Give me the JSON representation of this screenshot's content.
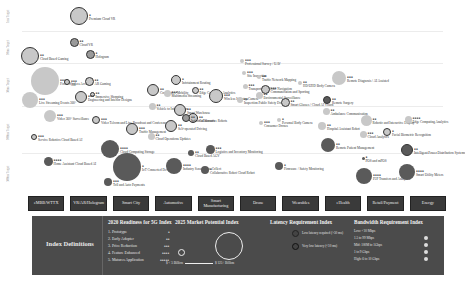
{
  "chart_data": {
    "type": "bubble",
    "ylabel": "Latency Target",
    "row_labels": [
      "1ms Target",
      "10ms Target",
      "50ms Target",
      "100ms Target",
      "500ms Target"
    ],
    "categories": [
      "eMBB/WTTX",
      "VR/AR/Hologram",
      "Smart City",
      "Automotive",
      "Smart Manufacturing",
      "Drone",
      "Wearables",
      "eHealth",
      "Retail/Payment",
      "Energy"
    ],
    "points": [
      {
        "label": "Premium Cloud VR",
        "readiness": "●",
        "x": 79,
        "y": 16,
        "r": 9,
        "shade": "light-ring"
      },
      {
        "label": "Cloud Based Gaming",
        "readiness": "●●",
        "x": 30,
        "y": 56,
        "r": 9,
        "shade": "light-ring"
      },
      {
        "label": "Cloud VR",
        "readiness": "●●",
        "x": 74,
        "y": 42,
        "r": 4.5,
        "shade": "mid-ring"
      },
      {
        "label": "Hologram",
        "readiness": "●",
        "x": 90,
        "y": 54,
        "r": 4.5,
        "shade": "mid-ring"
      },
      {
        "label": "Fixed Wireless Access",
        "readiness": "●●●●",
        "x": 45,
        "y": 81,
        "r": 14,
        "shade": "light"
      },
      {
        "label": "AR",
        "readiness": "●●●",
        "x": 67,
        "y": 82,
        "r": 3,
        "shade": "light-ring"
      },
      {
        "label": "AR Gaming",
        "readiness": "●●",
        "x": 89,
        "y": 81,
        "r": 4.5,
        "shade": "light-ring"
      },
      {
        "label": "Immersive Shopping",
        "readiness": "●●",
        "x": 92,
        "y": 94,
        "r": 2.5,
        "shade": "light-ring"
      },
      {
        "label": "Engineering and Interior Designs",
        "readiness": "●●●",
        "x": 81,
        "y": 97,
        "r": 6,
        "shade": "light-ring"
      },
      {
        "label": "Live Streaming Events 360°",
        "readiness": "●●●",
        "x": 30,
        "y": 100,
        "r": 8,
        "shade": "light"
      },
      {
        "label": "Video 360° Surveillance",
        "readiness": "●●●",
        "x": 50,
        "y": 116,
        "r": 6,
        "shade": "light"
      },
      {
        "label": "Video Telcom and Live Broadcast and Conferences",
        "readiness": "●●●",
        "x": 96,
        "y": 120,
        "r": 4,
        "shade": "light-ring"
      },
      {
        "label": "Service Robotics Cloud Based AI",
        "readiness": "●●●",
        "x": 34,
        "y": 137,
        "r": 3,
        "shade": "light-ring"
      },
      {
        "label": "Home Assistant Cloud Based AI",
        "readiness": "●●●●",
        "x": 48,
        "y": 161,
        "r": 4.5,
        "shade": "dark"
      },
      {
        "label": "Traffic Management",
        "readiness": "●●●",
        "x": 132,
        "y": 129,
        "r": 6,
        "shade": "light-ring"
      },
      {
        "label": "Cloud Computing Storage",
        "readiness": "●●●●",
        "x": 110,
        "y": 149,
        "r": 9,
        "shade": "dark"
      },
      {
        "label": "IoT Connected Devices",
        "readiness": "●",
        "x": 127,
        "y": 167,
        "r": 14,
        "shade": "dark"
      },
      {
        "label": "Toll and Auto Payments",
        "readiness": "●●●",
        "x": 108,
        "y": 182,
        "r": 4,
        "shade": "dark"
      },
      {
        "label": "Cloud Operations Updates",
        "readiness": "●●",
        "x": 151,
        "y": 136,
        "r": 3.5,
        "shade": "light"
      },
      {
        "label": "Cooperative Mobility",
        "readiness": "●●",
        "x": 153,
        "y": 90,
        "r": 6,
        "shade": "light-ring"
      },
      {
        "label": "Vehicle to Infrastructure",
        "readiness": "●●",
        "x": 152,
        "y": 106,
        "r": 3.5,
        "shade": "light"
      },
      {
        "label": "Infotainment Routing",
        "readiness": "●",
        "x": 176,
        "y": 80,
        "r": 5,
        "shade": "light-ring"
      },
      {
        "label": "Multimedia Streaming",
        "readiness": "●●●",
        "x": 167,
        "y": 93,
        "r": 3.5,
        "shade": "light"
      },
      {
        "label": "Smart Warehouse",
        "readiness": "●●",
        "x": 180,
        "y": 110,
        "r": 6,
        "shade": "light-ring"
      },
      {
        "label": "Self-operated Driving",
        "readiness": "●●",
        "x": 171,
        "y": 126,
        "r": 6,
        "shade": "light-ring"
      },
      {
        "label": "Edge Computing Analytics",
        "readiness": "●●",
        "x": 195,
        "y": 90,
        "r": 3.5,
        "shade": "light-ring"
      },
      {
        "label": "Wireless Industry Camera",
        "readiness": "●●●",
        "x": 216,
        "y": 96,
        "r": 7,
        "shade": "light-ring"
      },
      {
        "label": "Collaborative Robots",
        "readiness": "●●",
        "x": 193,
        "y": 118,
        "r": 5,
        "shade": "light-ring"
      },
      {
        "label": "Industrial Sensors",
        "readiness": "●●",
        "x": 186,
        "y": 118,
        "r": 4,
        "shade": "mid-ring"
      },
      {
        "label": "Logistics and Inventory Monitoring",
        "readiness": "●●●",
        "x": 210,
        "y": 149,
        "r": 4.5,
        "shade": "dark"
      },
      {
        "label": "Cloud Based AGV",
        "readiness": "●●",
        "x": 191,
        "y": 153,
        "r": 3,
        "shade": "dark"
      },
      {
        "label": "Industry Sensor Data Collect",
        "readiness": "●●●●",
        "x": 174,
        "y": 166,
        "r": 8,
        "shade": "dark"
      },
      {
        "label": "Collaborative Robot Cloud Robot",
        "readiness": "●",
        "x": 205,
        "y": 170,
        "r": 4,
        "shade": "dark"
      },
      {
        "label": "Professional Survey / UAV",
        "readiness": "●●●",
        "x": 242,
        "y": 61,
        "r": 2,
        "shade": "light"
      },
      {
        "label": "Site Inspection",
        "readiness": "●●●",
        "x": 244,
        "y": 73,
        "r": 2,
        "shade": "light"
      },
      {
        "label": "Traffic Network Mapping",
        "readiness": "●●",
        "x": 259,
        "y": 77,
        "r": 2,
        "shade": "light"
      },
      {
        "label": "Transportation Route Navigation",
        "readiness": "●●●",
        "x": 245,
        "y": 86,
        "r": 2.5,
        "shade": "light"
      },
      {
        "label": "Environmental Surveillance",
        "readiness": "●●",
        "x": 259,
        "y": 95,
        "r": 3.5,
        "shade": "light"
      },
      {
        "label": "Inspection Public Safety Drones",
        "readiness": "●●",
        "x": 240,
        "y": 100,
        "r": 3,
        "shade": "light"
      },
      {
        "label": "Consumer Drones",
        "readiness": "●●●",
        "x": 261,
        "y": 123,
        "r": 2,
        "shade": "light"
      },
      {
        "label": "Firmware / Safety Monitoring",
        "readiness": "●",
        "x": 279,
        "y": 166,
        "r": 4,
        "shade": "dark"
      },
      {
        "label": "Communication and Sporting",
        "readiness": "●●●",
        "x": 265,
        "y": 89,
        "r": 4.5,
        "shade": "light-ring"
      },
      {
        "label": "Smart Glasses / Cloud AI Vision",
        "readiness": "●●",
        "x": 285,
        "y": 102,
        "r": 4.5,
        "shade": "light-ring"
      },
      {
        "label": "Personal Body Camera",
        "readiness": "●",
        "x": 279,
        "y": 120,
        "r": 2,
        "shade": "light"
      },
      {
        "label": "HD/UHD Body Camera",
        "readiness": "●●",
        "x": 300,
        "y": 83,
        "r": 2,
        "shade": "light"
      },
      {
        "label": "Remote Diagnosis / AI Assisted",
        "readiness": "●●●",
        "x": 339,
        "y": 78,
        "r": 7,
        "shade": "light"
      },
      {
        "label": "Remote Surgery",
        "readiness": "●●",
        "x": 327,
        "y": 100,
        "r": 4,
        "shade": "dark-ring"
      },
      {
        "label": "Ambulance Communication",
        "readiness": "●●",
        "x": 326,
        "y": 111,
        "r": 3.5,
        "shade": "light"
      },
      {
        "label": "Hospital Assistant Robot",
        "readiness": "●●",
        "x": 322,
        "y": 126,
        "r": 4,
        "shade": "light"
      },
      {
        "label": "Remote Patient Management",
        "readiness": "●●",
        "x": 328,
        "y": 145,
        "r": 7,
        "shade": "dark"
      },
      {
        "label": "Robotic and Interactive Display",
        "readiness": "●●",
        "x": 366,
        "y": 120,
        "r": 5.5,
        "shade": "light"
      },
      {
        "label": "Cloud Analytics",
        "readiness": "●●●",
        "x": 363,
        "y": 134,
        "r": 3.5,
        "shade": "light"
      },
      {
        "label": "Facial Biometric Recognition",
        "readiness": "●",
        "x": 387,
        "y": 132,
        "r": 4,
        "shade": "light-ring"
      },
      {
        "label": "POS and mPOS",
        "readiness": "●",
        "x": 363,
        "y": 158,
        "r": 1.5,
        "shade": "dark"
      },
      {
        "label": "P2P Transfers and Analytics",
        "readiness": "●●●●",
        "x": 364,
        "y": 176,
        "r": 8,
        "shade": "dark"
      },
      {
        "label": "Edge Computing Analytics",
        "readiness": "●●●●",
        "x": 408,
        "y": 119,
        "r": 3.5,
        "shade": "light"
      },
      {
        "label": "Intelligent Power Distribution Systems",
        "readiness": "●●",
        "x": 407,
        "y": 150,
        "r": 6,
        "shade": "dark-ring"
      },
      {
        "label": "Smart Utility Meters",
        "readiness": "●●●●",
        "x": 407,
        "y": 172,
        "r": 8,
        "shade": "dark"
      }
    ],
    "legend": {
      "readiness_title": "2020 Readiness for 5G Index",
      "readiness_levels": [
        "1. Prototype ●",
        "2. Early Adopter ●●",
        "3. Price Reduction ●●●",
        "4. Feature Enhanced ●●●●",
        "5. Matures Application ●●●●●"
      ],
      "market_title": "2025 Market Potential Index",
      "market_range": [
        "$ < 5 Billion",
        "$ 125+ Billion"
      ],
      "latency_title": "Latency Requirement Index",
      "latency_levels": [
        "Low latency required (>50 ms)",
        "Very low latency (<10 ms)"
      ],
      "bandwidth_title": "Bandwidth Requirement Index",
      "bandwidth_levels": [
        "Low: <10 Mbps",
        "1.5 to 99 Mbps",
        "Mid: 100M to 1Gbps",
        "1 to 9 Gbps",
        "High: 6 to 10 Gbps"
      ]
    }
  },
  "categories": [
    "eMBB/WTTX",
    "VR/AR/Hologram",
    "Smart City",
    "Automotive",
    "Smart Manufacturing",
    "Drone",
    "Wearables",
    "eHealth",
    "Retail/Payment",
    "Energy"
  ],
  "rows": [
    "1ms Target",
    "10ms Target",
    "50ms Target",
    "100ms Target",
    "500ms Target"
  ],
  "legend": {
    "title": "Index Definitions",
    "readiness": {
      "title": "2020 Readiness for 5G Index",
      "items": [
        {
          "label": "1. Prototype",
          "dots": "●"
        },
        {
          "label": "2. Early Adopter",
          "dots": "●●"
        },
        {
          "label": "3. Price Reduction",
          "dots": "●●●"
        },
        {
          "label": "4. Feature Enhanced",
          "dots": "●●●●"
        },
        {
          "label": "5. Matures Application",
          "dots": "●●●●●"
        }
      ]
    },
    "market": {
      "title": "2025 Market Potential Index",
      "low": "$ < 5 Billion",
      "high": "$ 125+ Billion"
    },
    "latency": {
      "title": "Latency Requirement Index",
      "items": [
        "Low latency required (>50 ms)",
        "Very low latency (<10 ms)"
      ]
    },
    "bandwidth": {
      "title": "Bandwidth Requirement Index",
      "items": [
        "Low: <10 Mbps",
        "1.5 to 99 Mbps",
        "Mid: 100M to 1Gbps",
        "1 to 9 Gbps",
        "High: 6 to 10 Gbps"
      ]
    }
  },
  "colors": {
    "light": "#c8c8c8",
    "mid": "#9a9a9a",
    "dark": "#5a5a5a",
    "ring": "#333333",
    "panel": "#4b4b4b",
    "category": "#3a3a3a"
  }
}
